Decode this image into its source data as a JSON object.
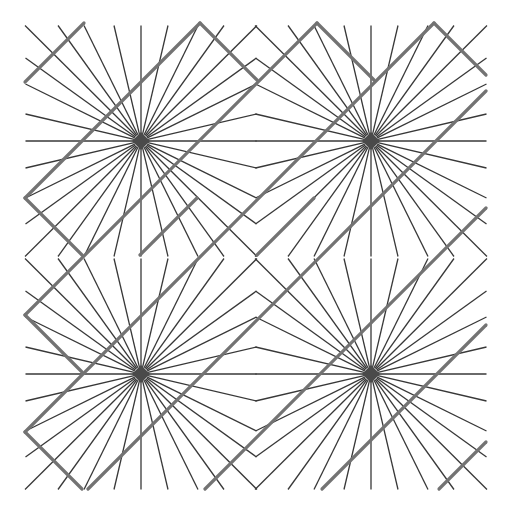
{
  "figure": {
    "background": "#ffffff",
    "thin_line_color": "#383838",
    "thick_line_color": "#737373",
    "hub_color": "#4a4a4a",
    "bounds": {
      "x0": 25,
      "y0": 23,
      "x1": 486,
      "y1": 489
    },
    "grid": {
      "cols": 2,
      "rows": 2,
      "cell_size": 231
    },
    "centers": [
      {
        "x": 141,
        "y": 141
      },
      {
        "x": 371,
        "y": 141
      },
      {
        "x": 141,
        "y": 374
      },
      {
        "x": 371,
        "y": 374
      }
    ],
    "ray_edge_offsets": [
      -116,
      -83,
      -57,
      -27,
      0,
      27,
      57,
      83,
      116
    ],
    "thick_lines": [
      [
        84,
        23,
        25,
        82
      ],
      [
        25,
        198,
        200,
        23
      ],
      [
        25,
        315,
        317,
        23
      ],
      [
        25,
        432,
        434,
        23
      ],
      [
        88,
        489,
        486,
        91
      ],
      [
        205,
        489,
        486,
        208
      ],
      [
        322,
        489,
        486,
        325
      ],
      [
        439,
        489,
        486,
        442
      ],
      [
        200,
        23,
        257,
        80
      ],
      [
        317,
        23,
        374,
        80
      ],
      [
        434,
        23,
        486,
        75
      ],
      [
        25,
        198,
        82,
        255
      ],
      [
        25,
        315,
        82,
        372
      ],
      [
        25,
        432,
        82,
        489
      ],
      [
        257,
        255,
        314,
        198
      ],
      [
        140,
        255,
        197,
        198
      ]
    ]
  }
}
